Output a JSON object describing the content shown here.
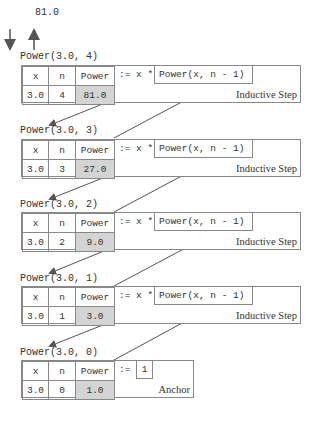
{
  "result_value": "81.0",
  "frames": [
    {
      "call": "Power(3.0, 4)",
      "headers": [
        "x",
        "n",
        "Power"
      ],
      "values": [
        "3.0",
        "4",
        "81.0"
      ],
      "assign": ":= x *",
      "recursive_call": "Power(x, n - 1)",
      "label": "Inductive Step"
    },
    {
      "call": "Power(3.0, 3)",
      "headers": [
        "x",
        "n",
        "Power"
      ],
      "values": [
        "3.0",
        "3",
        "27.0"
      ],
      "assign": ":= x *",
      "recursive_call": "Power(x, n - 1)",
      "label": "Inductive Step"
    },
    {
      "call": "Power(3.0, 2)",
      "headers": [
        "x",
        "n",
        "Power"
      ],
      "values": [
        "3.0",
        "2",
        "9.0"
      ],
      "assign": ":= x *",
      "recursive_call": "Power(x, n - 1)",
      "label": "Inductive Step"
    },
    {
      "call": "Power(3.0, 1)",
      "headers": [
        "x",
        "n",
        "Power"
      ],
      "values": [
        "3.0",
        "1",
        "3.0"
      ],
      "assign": ":= x *",
      "recursive_call": "Power(x, n - 1)",
      "label": "Inductive Step"
    },
    {
      "call": "Power(3.0, 0)",
      "headers": [
        "x",
        "n",
        "Power"
      ],
      "values": [
        "3.0",
        "0",
        "1.0"
      ],
      "assign": ":=",
      "anchor_value": "1",
      "label": "Anchor"
    }
  ],
  "colors": {
    "line": "#666666",
    "shade": "#d4d4d4"
  }
}
